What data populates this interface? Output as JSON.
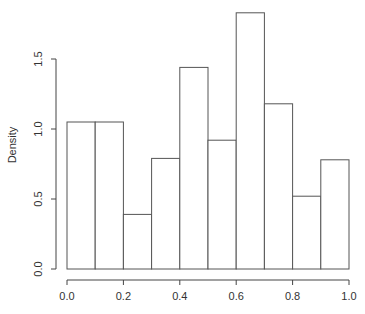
{
  "chart_data": {
    "type": "bar",
    "subtype": "histogram",
    "title": "",
    "xlabel": "",
    "ylabel": "Density",
    "bin_edges": [
      0.0,
      0.1,
      0.2,
      0.3,
      0.4,
      0.5,
      0.6,
      0.7,
      0.8,
      0.9,
      1.0
    ],
    "categories": [
      "0.0-0.1",
      "0.1-0.2",
      "0.2-0.3",
      "0.3-0.4",
      "0.4-0.5",
      "0.5-0.6",
      "0.6-0.7",
      "0.7-0.8",
      "0.8-0.9",
      "0.9-1.0"
    ],
    "values": [
      1.05,
      1.05,
      0.39,
      0.79,
      1.44,
      0.92,
      1.83,
      1.18,
      0.52,
      0.78
    ],
    "xlim": [
      0.0,
      1.0
    ],
    "ylim": [
      0.0,
      1.5
    ],
    "x_ticks": [
      0.0,
      0.2,
      0.4,
      0.6,
      0.8,
      1.0
    ],
    "x_tick_labels": [
      "0.0",
      "0.2",
      "0.4",
      "0.6",
      "0.8",
      "1.0"
    ],
    "y_ticks": [
      0.0,
      0.5,
      1.0,
      1.5
    ],
    "y_tick_labels": [
      "0.0",
      "0.5",
      "1.0",
      "1.5"
    ],
    "grid": false,
    "legend": null,
    "colors": {
      "bar_fill": "#ffffff",
      "bar_stroke": "#555555",
      "axis": "#444444",
      "text": "#333333"
    }
  }
}
